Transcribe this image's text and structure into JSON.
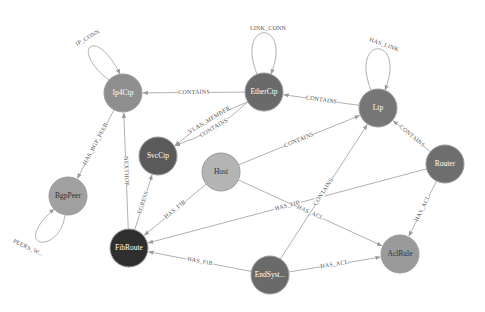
{
  "graph": {
    "nodes": [
      {
        "id": "Ip4Ctp",
        "label": "Ip4Ctp",
        "x": 123,
        "y": 93,
        "r": 19,
        "fill": "#8e8e8e",
        "text": "#ffffff"
      },
      {
        "id": "EtherCtp",
        "label": "EtherCtp",
        "x": 264,
        "y": 92,
        "r": 19,
        "fill": "#6a6a6a",
        "text": "#ffffff"
      },
      {
        "id": "Ltp",
        "label": "Ltp",
        "x": 378,
        "y": 108,
        "r": 19,
        "fill": "#767676",
        "text": "#ffffff"
      },
      {
        "id": "SvcCtp",
        "label": "SvcCtp",
        "x": 158,
        "y": 156,
        "r": 19,
        "fill": "#5a5a5a",
        "text": "#ffffff"
      },
      {
        "id": "Host",
        "label": "Host",
        "x": 221,
        "y": 172,
        "r": 19,
        "fill": "#b4b4b4",
        "text": "#333333"
      },
      {
        "id": "Router",
        "label": "Router",
        "x": 445,
        "y": 164,
        "r": 19,
        "fill": "#6e6e6e",
        "text": "#ffffff"
      },
      {
        "id": "BgpPeer",
        "label": "BgpPeer",
        "x": 68,
        "y": 196,
        "r": 19,
        "fill": "#a0a0a0",
        "text": "#333333"
      },
      {
        "id": "FibRoute",
        "label": "FibRoute",
        "x": 129,
        "y": 248,
        "r": 19,
        "fill": "#2e2e2e",
        "text": "#ffffff"
      },
      {
        "id": "EndSyst",
        "label": "EndSyst...",
        "x": 270,
        "y": 275,
        "r": 19,
        "fill": "#6a6a6a",
        "text": "#ffffff"
      },
      {
        "id": "AclRule",
        "label": "AclRule",
        "x": 400,
        "y": 254,
        "r": 19,
        "fill": "#9a9a9a",
        "text": "#333333"
      }
    ],
    "edges": [
      {
        "from": "Ip4Ctp",
        "to": "Ip4Ctp",
        "label": "IP_CONN",
        "loop": "up-left"
      },
      {
        "from": "EtherCtp",
        "to": "EtherCtp",
        "label": "LINK_CONN",
        "loop": "up"
      },
      {
        "from": "Ltp",
        "to": "Ltp",
        "label": "HAS_LINK",
        "loop": "up"
      },
      {
        "from": "BgpPeer",
        "to": "BgpPeer",
        "label": "PEERS_W...",
        "loop": "down-left"
      },
      {
        "from": "EtherCtp",
        "to": "Ip4Ctp",
        "label": "CONTAINS"
      },
      {
        "from": "Ltp",
        "to": "EtherCtp",
        "label": "CONTAINS"
      },
      {
        "from": "EtherCtp",
        "to": "SvcCtp",
        "label": "CONTAINS",
        "curve": -10
      },
      {
        "from": "EtherCtp",
        "to": "SvcCtp",
        "label": "VLAN_MEMBER",
        "curve": 8
      },
      {
        "from": "Host",
        "to": "Ltp",
        "label": "CONTAINS"
      },
      {
        "from": "Router",
        "to": "Ltp",
        "label": "CONTAINS"
      },
      {
        "from": "Ip4Ctp",
        "to": "BgpPeer",
        "label": "HAS_BGP_PEER"
      },
      {
        "from": "FibRoute",
        "to": "Ip4Ctp",
        "label": "NEXTHOP"
      },
      {
        "from": "FibRoute",
        "to": "SvcCtp",
        "label": "EGRESS"
      },
      {
        "from": "Host",
        "to": "FibRoute",
        "label": "HAS_FIB"
      },
      {
        "from": "Router",
        "to": "FibRoute",
        "label": "HAS_FIB"
      },
      {
        "from": "Host",
        "to": "AclRule",
        "label": "HAS_ACL"
      },
      {
        "from": "Router",
        "to": "AclRule",
        "label": "HAS_ACL"
      },
      {
        "from": "EndSyst",
        "to": "FibRoute",
        "label": "HAS_FIB"
      },
      {
        "from": "EndSyst",
        "to": "AclRule",
        "label": "HAS_ACL"
      },
      {
        "from": "EndSyst",
        "to": "Ltp",
        "label": "CONTAINS"
      }
    ],
    "edge_color": "#a8a8a8"
  }
}
